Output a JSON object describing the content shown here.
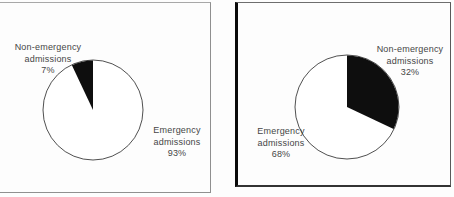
{
  "figure": {
    "background_color": "#fdfdfd",
    "text_color": "#464646",
    "wedge_color": "#0e0e0e",
    "circle_fill": "#ffffff",
    "circle_stroke": "#3c3c3c"
  },
  "chart_data": [
    {
      "type": "pie",
      "title": "",
      "start": "12-oclock",
      "wedge_direction": "counterclockwise",
      "slices": [
        {
          "label": "Non-emergency admissions",
          "value_pct": 7,
          "color": "#0e0e0e",
          "label_lines": [
            "Non-emergency",
            "admissions",
            "7%"
          ]
        },
        {
          "label": "Emergency admissions",
          "value_pct": 93,
          "color": "#ffffff",
          "label_lines": [
            "Emergency",
            "admissions",
            "93%"
          ]
        }
      ]
    },
    {
      "type": "pie",
      "title": "",
      "start": "12-oclock",
      "wedge_direction": "clockwise",
      "slices": [
        {
          "label": "Non-emergency admissions",
          "value_pct": 32,
          "color": "#0e0e0e",
          "label_lines": [
            "Non-emergency",
            "admissions",
            "32%"
          ]
        },
        {
          "label": "Emergency admissions",
          "value_pct": 68,
          "color": "#ffffff",
          "label_lines": [
            "Emergency",
            "admissions",
            "68%"
          ]
        }
      ]
    }
  ]
}
